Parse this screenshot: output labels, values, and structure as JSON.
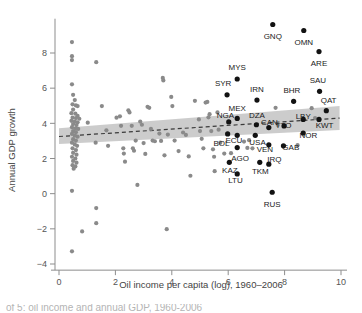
{
  "figure": {
    "caption_partial": "of 5: oil income and annual GDP, 1960-2006"
  },
  "chart_data": {
    "type": "scatter",
    "title": "",
    "xlabel": "Oil income per capita (log), 1960–2006",
    "ylabel": "Annual GDP growth",
    "xlim": [
      -0.35,
      10.4
    ],
    "ylim": [
      -4.6,
      10.1
    ],
    "xticks": [
      0,
      2,
      4,
      6,
      8,
      10
    ],
    "xtick_labels": [
      "0",
      "2",
      "4",
      "6",
      "8",
      "10"
    ],
    "yticks": [
      -4,
      -2,
      0,
      2,
      4,
      6,
      8
    ],
    "ytick_labels": [
      "−4",
      "−2",
      "0",
      "2",
      "4",
      "6",
      "8"
    ],
    "grid": false,
    "legend": null,
    "colors": {
      "point_plain": "#8a8a8a",
      "point_highlighted": "#121212",
      "fit_line": "#3a3a3a",
      "ci_band": "#b9b9b9",
      "axis": "#8d8d8d"
    },
    "fit_line": {
      "style": "dashed",
      "x_start": 0.0,
      "x_end": 9.95,
      "y_start": 3.25,
      "y_end": 4.3
    },
    "ci_band": {
      "x_start": 0.0,
      "x_end": 9.95,
      "upper_start": 3.72,
      "upper_end": 4.98,
      "lower_start": 2.82,
      "lower_end": 3.62
    },
    "labeled_points": [
      {
        "label": "GNQ",
        "x": 7.58,
        "y": 9.62,
        "lx": 7.58,
        "ly": 8.95,
        "anchor": "middle"
      },
      {
        "label": "OMN",
        "x": 8.68,
        "y": 9.28,
        "lx": 8.68,
        "ly": 8.62,
        "anchor": "middle"
      },
      {
        "label": "ARE",
        "x": 9.22,
        "y": 8.08,
        "lx": 9.22,
        "ly": 7.42,
        "anchor": "middle"
      },
      {
        "label": "MYS",
        "x": 6.32,
        "y": 6.52,
        "lx": 6.32,
        "ly": 7.18,
        "anchor": "middle"
      },
      {
        "label": "SYR",
        "x": 5.96,
        "y": 5.62,
        "lx": 5.82,
        "ly": 6.28,
        "anchor": "middle"
      },
      {
        "label": "IRN",
        "x": 7.02,
        "y": 5.32,
        "lx": 7.02,
        "ly": 5.98,
        "anchor": "middle"
      },
      {
        "label": "BHR",
        "x": 8.32,
        "y": 5.25,
        "lx": 8.26,
        "ly": 5.92,
        "anchor": "middle"
      },
      {
        "label": "SAU",
        "x": 9.24,
        "y": 5.82,
        "lx": 9.18,
        "ly": 6.48,
        "anchor": "middle"
      },
      {
        "label": "QAT",
        "x": 9.48,
        "y": 4.72,
        "lx": 9.56,
        "ly": 5.32,
        "anchor": "middle"
      },
      {
        "label": "MEX",
        "x": 6.32,
        "y": 4.28,
        "lx": 6.32,
        "ly": 4.9,
        "anchor": "middle"
      },
      {
        "label": "NGA",
        "x": 6.02,
        "y": 4.08,
        "lx": 5.9,
        "ly": 4.5,
        "anchor": "middle"
      },
      {
        "label": "DZA",
        "x": 7.0,
        "y": 3.92,
        "lx": 7.02,
        "ly": 4.48,
        "anchor": "middle"
      },
      {
        "label": "CAN",
        "x": 7.44,
        "y": 3.76,
        "lx": 7.46,
        "ly": 4.1,
        "anchor": "middle"
      },
      {
        "label": "TTO",
        "x": 7.98,
        "y": 3.85,
        "lx": 7.96,
        "ly": 3.88,
        "anchor": "middle"
      },
      {
        "label": "LBY",
        "x": 8.66,
        "y": 4.22,
        "lx": 8.66,
        "ly": 4.42,
        "anchor": "middle"
      },
      {
        "label": "KWT",
        "x": 9.22,
        "y": 4.22,
        "lx": 9.42,
        "ly": 3.9,
        "anchor": "middle"
      },
      {
        "label": "NOR",
        "x": 8.66,
        "y": 3.45,
        "lx": 8.84,
        "ly": 3.35,
        "anchor": "middle"
      },
      {
        "label": "GAB",
        "x": 7.96,
        "y": 2.72,
        "lx": 8.22,
        "ly": 2.68,
        "anchor": "middle"
      },
      {
        "label": "ECU",
        "x": 6.32,
        "y": 3.32,
        "lx": 6.2,
        "ly": 3.05,
        "anchor": "middle"
      },
      {
        "label": "USA",
        "x": 6.96,
        "y": 3.32,
        "lx": 7.04,
        "ly": 2.92,
        "anchor": "middle"
      },
      {
        "label": "VEN",
        "x": 7.44,
        "y": 2.78,
        "lx": 7.3,
        "ly": 2.52,
        "anchor": "middle"
      },
      {
        "label": "BOL",
        "x": 5.98,
        "y": 3.4,
        "lx": 5.76,
        "ly": 2.9,
        "anchor": "middle"
      },
      {
        "label": "AGO",
        "x": 6.32,
        "y": 2.62,
        "lx": 6.42,
        "ly": 2.05,
        "anchor": "middle"
      },
      {
        "label": "IRQ",
        "x": 7.44,
        "y": 1.68,
        "lx": 7.64,
        "ly": 1.98,
        "anchor": "middle"
      },
      {
        "label": "KAZ",
        "x": 6.04,
        "y": 1.78,
        "lx": 6.06,
        "ly": 1.35,
        "anchor": "middle"
      },
      {
        "label": "LTU",
        "x": 6.32,
        "y": 1.12,
        "lx": 6.26,
        "ly": 0.78,
        "anchor": "middle"
      },
      {
        "label": "TKM",
        "x": 7.12,
        "y": 1.78,
        "lx": 7.14,
        "ly": 1.3,
        "anchor": "middle"
      },
      {
        "label": "RUS",
        "x": 7.56,
        "y": 0.08,
        "lx": 7.56,
        "ly": -0.58,
        "anchor": "middle"
      }
    ],
    "plain_points": [
      {
        "x": 0.46,
        "y": 8.62
      },
      {
        "x": 0.46,
        "y": 7.82
      },
      {
        "x": 0.46,
        "y": 7.6
      },
      {
        "x": 1.32,
        "y": 7.48
      },
      {
        "x": 0.46,
        "y": 6.22
      },
      {
        "x": 0.5,
        "y": 5.62
      },
      {
        "x": 0.56,
        "y": 5.32
      },
      {
        "x": 0.48,
        "y": 5.08
      },
      {
        "x": 0.6,
        "y": 5.02
      },
      {
        "x": 0.66,
        "y": 4.98
      },
      {
        "x": 0.5,
        "y": 4.78
      },
      {
        "x": 0.44,
        "y": 4.58
      },
      {
        "x": 0.58,
        "y": 4.55
      },
      {
        "x": 0.66,
        "y": 4.42
      },
      {
        "x": 0.48,
        "y": 4.32
      },
      {
        "x": 0.6,
        "y": 4.3
      },
      {
        "x": 0.72,
        "y": 4.26
      },
      {
        "x": 0.44,
        "y": 4.14
      },
      {
        "x": 0.56,
        "y": 4.1
      },
      {
        "x": 0.66,
        "y": 4.06
      },
      {
        "x": 0.5,
        "y": 3.96
      },
      {
        "x": 0.62,
        "y": 3.9
      },
      {
        "x": 0.46,
        "y": 3.78
      },
      {
        "x": 0.58,
        "y": 3.72
      },
      {
        "x": 0.68,
        "y": 3.68
      },
      {
        "x": 0.5,
        "y": 3.56
      },
      {
        "x": 0.6,
        "y": 3.5
      },
      {
        "x": 0.46,
        "y": 3.4
      },
      {
        "x": 0.56,
        "y": 3.3
      },
      {
        "x": 0.66,
        "y": 3.24
      },
      {
        "x": 0.5,
        "y": 3.1
      },
      {
        "x": 0.6,
        "y": 3.02
      },
      {
        "x": 0.46,
        "y": 2.9
      },
      {
        "x": 0.56,
        "y": 2.8
      },
      {
        "x": 0.64,
        "y": 2.72
      },
      {
        "x": 0.48,
        "y": 2.58
      },
      {
        "x": 0.6,
        "y": 2.48
      },
      {
        "x": 0.5,
        "y": 2.32
      },
      {
        "x": 0.62,
        "y": 2.22
      },
      {
        "x": 0.46,
        "y": 2.1
      },
      {
        "x": 0.58,
        "y": 2.0
      },
      {
        "x": 0.5,
        "y": 1.86
      },
      {
        "x": 0.62,
        "y": 1.76
      },
      {
        "x": 0.48,
        "y": 1.62
      },
      {
        "x": 0.58,
        "y": 1.55
      },
      {
        "x": 0.52,
        "y": 1.42
      },
      {
        "x": 0.46,
        "y": 0.16
      },
      {
        "x": 0.82,
        "y": -2.15
      },
      {
        "x": 0.46,
        "y": -3.28
      },
      {
        "x": 1.32,
        "y": -0.82
      },
      {
        "x": 1.32,
        "y": -1.68
      },
      {
        "x": 1.02,
        "y": 4.04
      },
      {
        "x": 1.3,
        "y": 2.9
      },
      {
        "x": 1.52,
        "y": 4.98
      },
      {
        "x": 1.68,
        "y": 3.6
      },
      {
        "x": 1.74,
        "y": 2.72
      },
      {
        "x": 2.04,
        "y": 4.32
      },
      {
        "x": 2.16,
        "y": 4.4
      },
      {
        "x": 2.2,
        "y": 3.86
      },
      {
        "x": 2.28,
        "y": 2.58
      },
      {
        "x": 2.3,
        "y": 2.28
      },
      {
        "x": 2.34,
        "y": 1.82
      },
      {
        "x": 2.46,
        "y": 4.74
      },
      {
        "x": 2.5,
        "y": 4.62
      },
      {
        "x": 2.58,
        "y": 3.86
      },
      {
        "x": 2.62,
        "y": 2.58
      },
      {
        "x": 2.66,
        "y": 2.44
      },
      {
        "x": 2.72,
        "y": 3.02
      },
      {
        "x": 2.78,
        "y": 0.5
      },
      {
        "x": 2.88,
        "y": 4.1
      },
      {
        "x": 2.94,
        "y": 3.92
      },
      {
        "x": 3.0,
        "y": 2.88
      },
      {
        "x": 3.06,
        "y": 2.26
      },
      {
        "x": 3.14,
        "y": 4.94
      },
      {
        "x": 3.2,
        "y": 4.88
      },
      {
        "x": 3.26,
        "y": 3.68
      },
      {
        "x": 3.32,
        "y": 3.02
      },
      {
        "x": 3.4,
        "y": 2.98
      },
      {
        "x": 3.56,
        "y": 3.42
      },
      {
        "x": 3.62,
        "y": 3.0
      },
      {
        "x": 3.68,
        "y": 6.58
      },
      {
        "x": 3.7,
        "y": 6.44
      },
      {
        "x": 3.74,
        "y": 2.18
      },
      {
        "x": 3.82,
        "y": -2.02
      },
      {
        "x": 3.86,
        "y": 3.36
      },
      {
        "x": 3.98,
        "y": 5.5
      },
      {
        "x": 4.02,
        "y": 4.98
      },
      {
        "x": 4.1,
        "y": 3.02
      },
      {
        "x": 4.24,
        "y": 2.42
      },
      {
        "x": 4.4,
        "y": 3.48
      },
      {
        "x": 4.5,
        "y": 3.34
      },
      {
        "x": 4.6,
        "y": 2.12
      },
      {
        "x": 4.66,
        "y": 1.02
      },
      {
        "x": 4.82,
        "y": 5.28
      },
      {
        "x": 4.96,
        "y": 4.22
      },
      {
        "x": 5.0,
        "y": 3.56
      },
      {
        "x": 5.06,
        "y": 3.12
      },
      {
        "x": 5.12,
        "y": 2.58
      },
      {
        "x": 5.2,
        "y": 5.18
      },
      {
        "x": 5.26,
        "y": 5.22
      },
      {
        "x": 5.3,
        "y": 4.34
      },
      {
        "x": 5.34,
        "y": 4.52
      },
      {
        "x": 5.4,
        "y": 3.56
      },
      {
        "x": 5.46,
        "y": 2.52
      },
      {
        "x": 5.5,
        "y": 2.1
      },
      {
        "x": 5.66,
        "y": 3.64
      },
      {
        "x": 5.72,
        "y": 2.9
      },
      {
        "x": 5.62,
        "y": 4.62
      },
      {
        "x": 6.56,
        "y": 2.96
      },
      {
        "x": 6.68,
        "y": 2.6
      },
      {
        "x": 6.74,
        "y": 3.04
      },
      {
        "x": 6.86,
        "y": 2.58
      },
      {
        "x": 7.68,
        "y": 4.88
      },
      {
        "x": 7.76,
        "y": 3.9
      },
      {
        "x": 8.96,
        "y": 4.86
      },
      {
        "x": 9.08,
        "y": 4.3
      },
      {
        "x": 6.1,
        "y": 2.3
      },
      {
        "x": 5.86,
        "y": 2.28
      },
      {
        "x": 5.52,
        "y": 1.28
      },
      {
        "x": 8.46,
        "y": 2.76
      }
    ]
  }
}
